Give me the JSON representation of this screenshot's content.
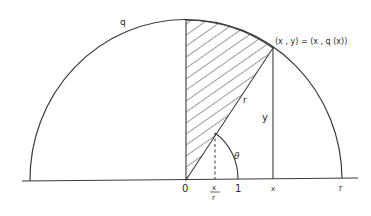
{
  "diagram": {
    "labels": {
      "curve": "q",
      "point": "(x , y) = (x , q (x))",
      "hyp": "r",
      "vertical": "y",
      "angle": "θ",
      "origin": "0",
      "frac_num": "x",
      "frac_den": "r",
      "one": "1",
      "x_tick": "x",
      "r_tick": "r"
    },
    "colors": {
      "stroke": "#3a3a3a",
      "hatch": "#3a3a3a",
      "background": "#ffffff"
    }
  }
}
